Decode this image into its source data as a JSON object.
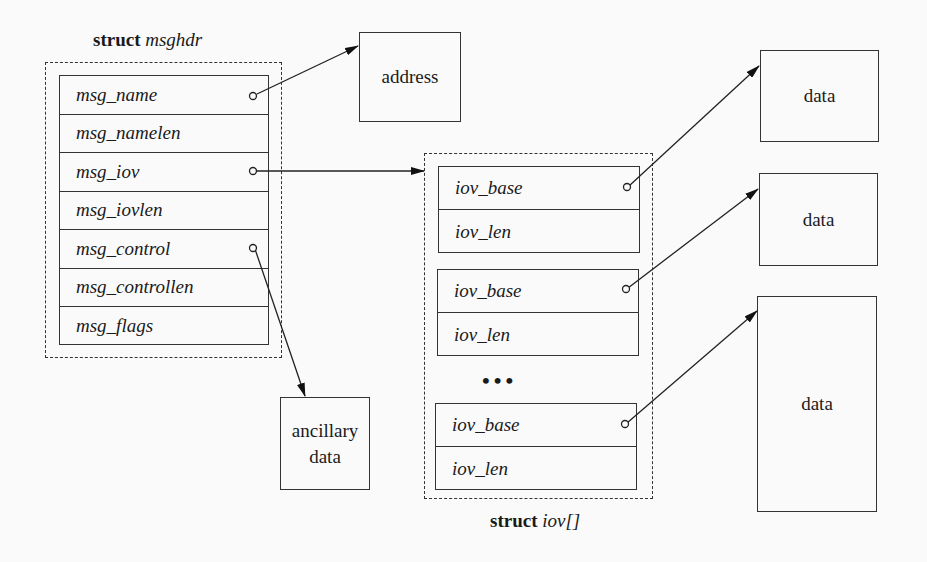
{
  "msghdr": {
    "title_keyword": "struct",
    "title_name": "msghdr",
    "fields": [
      {
        "name": "msg_name",
        "pointer": true
      },
      {
        "name": "msg_namelen",
        "pointer": false
      },
      {
        "name": "msg_iov",
        "pointer": true
      },
      {
        "name": "msg_iovlen",
        "pointer": false
      },
      {
        "name": "msg_control",
        "pointer": true
      },
      {
        "name": "msg_controllen",
        "pointer": false
      },
      {
        "name": "msg_flags",
        "pointer": false
      }
    ]
  },
  "address": {
    "label": "address"
  },
  "ancillary": {
    "line1": "ancillary",
    "line2": "data"
  },
  "iov": {
    "title_keyword": "struct",
    "title_name": "iov[]",
    "ellipsis": "•••",
    "entries": [
      {
        "base": "iov_base",
        "len": "iov_len"
      },
      {
        "base": "iov_base",
        "len": "iov_len"
      },
      {
        "base": "iov_base",
        "len": "iov_len"
      }
    ]
  },
  "data_buffers": [
    {
      "label": "data"
    },
    {
      "label": "data"
    },
    {
      "label": "data"
    }
  ]
}
